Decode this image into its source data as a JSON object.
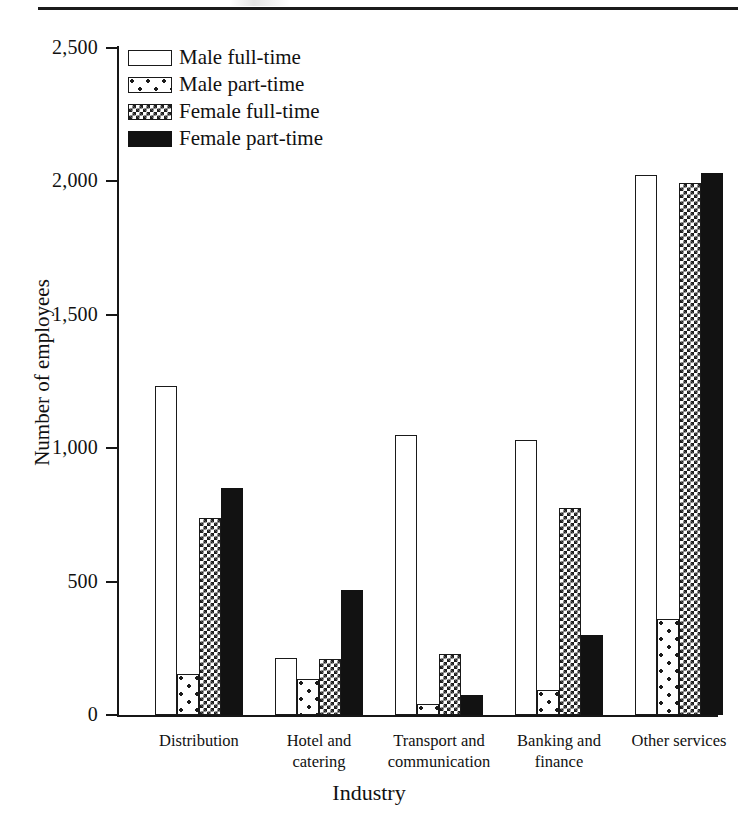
{
  "chart_data": {
    "type": "bar",
    "title": "",
    "xlabel": "Industry",
    "ylabel": "Number of employees",
    "categories": [
      "Distribution",
      "Hotel and catering",
      "Transport and communication",
      "Banking and finance",
      "Other services"
    ],
    "category_lines": [
      [
        "Distribution"
      ],
      [
        "Hotel and",
        "catering"
      ],
      [
        "Transport and",
        "communication"
      ],
      [
        "Banking and",
        "finance"
      ],
      [
        "Other services"
      ]
    ],
    "series": [
      {
        "name": "Male full-time",
        "pattern": "open-white",
        "values": [
          1235,
          215,
          1050,
          1030,
          2025
        ]
      },
      {
        "name": "Male part-time",
        "pattern": "sparse-dots",
        "values": [
          155,
          135,
          40,
          95,
          360
        ]
      },
      {
        "name": "Female full-time",
        "pattern": "checkerboard",
        "values": [
          740,
          210,
          230,
          775,
          1995
        ]
      },
      {
        "name": "Female part-time",
        "pattern": "solid-black",
        "values": [
          850,
          470,
          75,
          300,
          2030
        ]
      }
    ],
    "ylim": [
      0,
      2500
    ],
    "ytick_values": [
      0,
      500,
      1000,
      1500,
      2000,
      2500
    ],
    "ytick_labels": [
      "0",
      "500",
      "1,000",
      "1,500",
      "2,000",
      "2,500"
    ],
    "grid": false,
    "legend_position": "top-left",
    "legend_entries": [
      "Male full-time",
      "Male part-time",
      "Female full-time",
      "Female part-time"
    ]
  },
  "colors": {
    "ink": "#161616",
    "paper": "#ffffff",
    "solid_fill": "#121212"
  }
}
